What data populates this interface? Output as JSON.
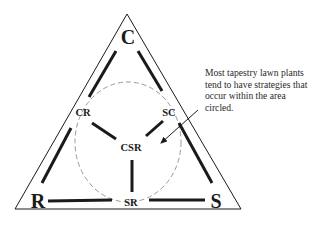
{
  "diagram": {
    "type": "CSR triangle (Grime's plant strategy model)",
    "corners": {
      "top": "C",
      "bottom_left": "R",
      "bottom_right": "S"
    },
    "edge_labels": {
      "left": "CR",
      "right": "SC",
      "bottom": "SR"
    },
    "center_label": "CSR",
    "annotation": {
      "lines": [
        "Most tapestry lawn plants",
        "tend to have strategies that",
        "occur within the area",
        "circled."
      ]
    },
    "colors": {
      "line": "#1a1a1a",
      "dashed_circle": "#9a9a9a",
      "background": "#ffffff"
    }
  }
}
